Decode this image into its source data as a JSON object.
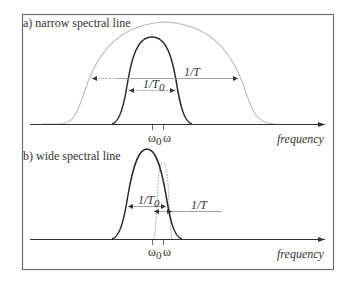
{
  "panel_a": {
    "title": "a) narrow spectral line",
    "inner_width_label": "1/T",
    "inner_width_sub": "0",
    "outer_width_label": "1/T",
    "omega0": "ω",
    "omega0_sub": "0",
    "omega": "ω",
    "axis_label": "frequency"
  },
  "panel_b": {
    "title": "b) wide spectral line",
    "wide_width_label": "1/T",
    "wide_width_sub": "0",
    "narrow_width_label": "1/T",
    "omega0": "ω",
    "omega0_sub": "0",
    "omega": "ω",
    "axis_label": "frequency"
  },
  "colors": {
    "frame": "#6e6e6e",
    "dark_curve": "#2a2a2a",
    "light_curve": "#b8b8b8",
    "arrow_line": "#9a9a9a"
  }
}
